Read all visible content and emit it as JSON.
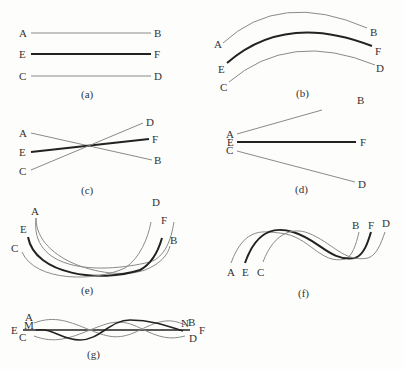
{
  "figure": {
    "panels": [
      {
        "id": "a",
        "caption": "(a)",
        "description": "Three parallel straight lines",
        "labels": {
          "A": "A",
          "B": "B",
          "E": "E",
          "F": "F",
          "C": "C",
          "D": "D"
        }
      },
      {
        "id": "b",
        "caption": "(b)",
        "description": "Three parallel concentric arcs",
        "labels": {
          "A": "A",
          "B": "B",
          "E": "E",
          "F": "F",
          "C": "C",
          "D": "D"
        }
      },
      {
        "id": "c",
        "caption": "(c)",
        "description": "Three lines crossing at one point",
        "labels": {
          "A": "A",
          "B": "B",
          "E": "E",
          "F": "F",
          "C": "C",
          "D": "D"
        }
      },
      {
        "id": "d",
        "caption": "(d)",
        "description": "Three lines fanning out from a common origin",
        "labels": {
          "A": "A",
          "B": "B",
          "E": "E",
          "F": "F",
          "C": "C",
          "D": "D"
        }
      },
      {
        "id": "e",
        "caption": "(e)",
        "description": "Three crossing U-shaped curves",
        "labels": {
          "A": "A",
          "B": "B",
          "E": "E",
          "F": "F",
          "C": "C",
          "D": "D"
        }
      },
      {
        "id": "f",
        "caption": "(f)",
        "description": "Three offset sinusoidal waves",
        "labels": {
          "A": "A",
          "B": "B",
          "E": "E",
          "F": "F",
          "C": "C",
          "D": "D"
        }
      },
      {
        "id": "g",
        "caption": "(g)",
        "description": "Interwoven waves around a straight axis",
        "labels": {
          "A": "A",
          "B": "B",
          "E": "E",
          "F": "F",
          "C": "C",
          "D": "D",
          "M": "M",
          "N": "N"
        }
      }
    ]
  }
}
